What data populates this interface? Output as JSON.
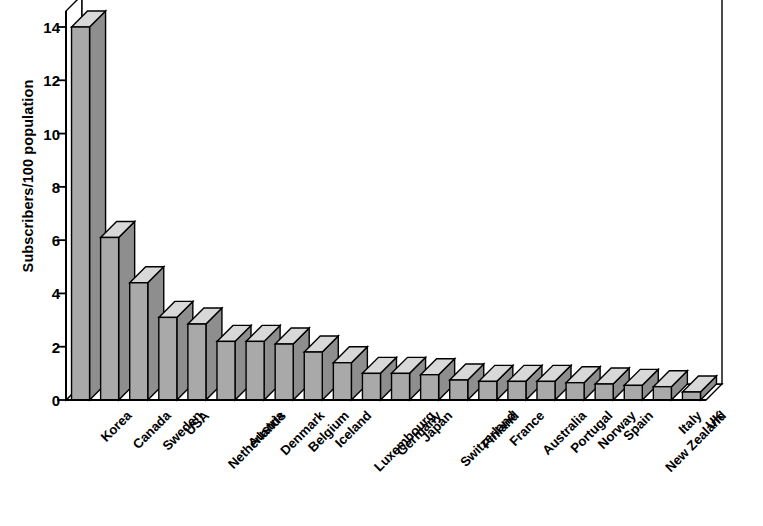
{
  "chart_data": {
    "type": "bar",
    "title": "",
    "subtitle": "",
    "xlabel": "",
    "ylabel": "Subscribers/100 population",
    "ylim": [
      0,
      14.6
    ],
    "yticks": [
      0,
      2,
      4,
      6,
      8,
      10,
      12,
      14
    ],
    "ytick_labels": [
      "0",
      "2",
      "4",
      "6",
      "8",
      "10",
      "12",
      "14"
    ],
    "grid": false,
    "legend": null,
    "style": "3d-bars-grayscale",
    "categories": [
      "Korea",
      "Canada",
      "Sweden",
      "USA",
      "Netherlands",
      "Austria",
      "Denmark",
      "Belgium",
      "Iceland",
      "Luxembourg",
      "Germany",
      "Japan",
      "Switzerland",
      "Finland",
      "France",
      "Australia",
      "Portugal",
      "Norway",
      "Spain",
      "New Zealand",
      "Italy",
      "UK"
    ],
    "values": [
      14.0,
      6.1,
      4.4,
      3.1,
      2.85,
      2.2,
      2.2,
      2.1,
      1.8,
      1.4,
      1.0,
      1.0,
      0.95,
      0.75,
      0.7,
      0.7,
      0.7,
      0.65,
      0.6,
      0.55,
      0.5,
      0.3
    ],
    "series": [
      {
        "name": "Subscribers/100 population",
        "values": [
          14.0,
          6.1,
          4.4,
          3.1,
          2.85,
          2.2,
          2.2,
          2.1,
          1.8,
          1.4,
          1.0,
          1.0,
          0.95,
          0.75,
          0.7,
          0.7,
          0.7,
          0.65,
          0.6,
          0.55,
          0.5,
          0.3
        ]
      }
    ],
    "colors": {
      "bar_front": "#a9a9a9",
      "bar_top": "#d8d8d8",
      "bar_side": "#8e8e8e",
      "outline": "#000000",
      "background": "#ffffff"
    }
  }
}
